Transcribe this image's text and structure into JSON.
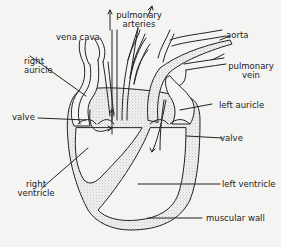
{
  "diagram": {
    "colors": {
      "background": "#f4f4f2",
      "ink": "#222222",
      "stipple": "#9a9a9a"
    },
    "labels": {
      "vena_cava": "vena cava",
      "pulmonary_arteries_1": "pulmonary",
      "pulmonary_arteries_2": "arteries",
      "aorta": "aorta",
      "pulmonary_vein_1": "pulmonary",
      "pulmonary_vein_2": "vein",
      "right_auricle_1": "right",
      "right_auricle_2": "auricle",
      "left_auricle": "left auricle",
      "valve_left": "valve",
      "valve_right": "valve",
      "right_ventricle_1": "right",
      "right_ventricle_2": "ventricle",
      "left_ventricle": "left ventricle",
      "muscular_wall": "muscular wall"
    }
  }
}
